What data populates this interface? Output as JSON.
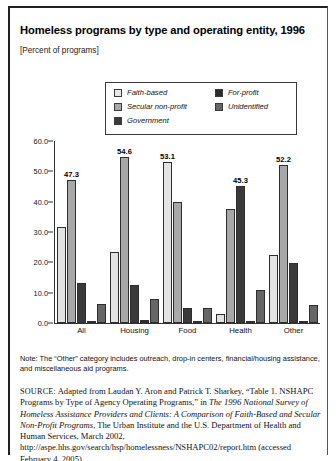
{
  "figure": {
    "title": "Homeless programs by type and operating entity, 1996",
    "subtitle": "[Percent of programs]",
    "note": "Note: The “Other” category includes outreach, drop-in centers, financial/housing assistance, and miscellaneous aid programs.",
    "source_label": "SOURCE:",
    "source_part1": " Adapted from Laudan Y. Aron and Patrick T. Sharkey, “Table 1. NSHAPC Programs by Type of Agency Operating Programs,” in ",
    "source_italic1": "The 1996 National Survey of Homeless Assistance Providers and Clients: A Comparison of Faith-Based and Secular Non-Profit Programs",
    "source_part2": ", The Urban Institute and the U.S. Department of Health and Human Services, March 2002, http://aspe.hhs.gov/search/hsp/homelessness/NSHAPC02/report.htm (accessed February 4, 2005)"
  },
  "chart_data": {
    "type": "bar",
    "title": "Homeless programs by type and operating entity, 1996",
    "subtitle": "[Percent of programs]",
    "xlabel": "",
    "ylabel": "",
    "ylim": [
      0.0,
      60.0
    ],
    "yticks": [
      "0.0",
      "10.0",
      "20.0",
      "30.0",
      "40.0",
      "50.0",
      "60.0"
    ],
    "ytick_values": [
      0.0,
      10.0,
      20.0,
      30.0,
      40.0,
      50.0,
      60.0
    ],
    "grid": false,
    "legend_position": "top-center",
    "categories": [
      "All",
      "Housing",
      "Food",
      "Health",
      "Other"
    ],
    "series": [
      {
        "name": "Faith-based",
        "color": "#e3e3e3",
        "values": [
          31.6,
          23.5,
          53.1,
          3.0,
          22.5
        ],
        "labels": [
          "",
          "",
          "53.1",
          "",
          ""
        ]
      },
      {
        "name": "Secular non-profit",
        "color": "#a8a8a8",
        "values": [
          47.3,
          54.6,
          40.0,
          37.5,
          52.2
        ],
        "labels": [
          "47.3",
          "54.6",
          "",
          "",
          "52.2"
        ]
      },
      {
        "name": "Government",
        "color": "#3a3a3a",
        "values": [
          13.2,
          12.5,
          5.0,
          45.3,
          19.8
        ],
        "labels": [
          "",
          "",
          "",
          "45.3",
          ""
        ]
      },
      {
        "name": "For-profit",
        "color": "#2b2b2b",
        "values": [
          0.6,
          1.0,
          0.8,
          0.6,
          0.8
        ],
        "labels": [
          "",
          "",
          "",
          "",
          ""
        ]
      },
      {
        "name": "Unidentified",
        "color": "#666666",
        "values": [
          6.2,
          8.0,
          4.8,
          11.0,
          5.8
        ],
        "labels": [
          "",
          "",
          "",
          "",
          ""
        ]
      }
    ]
  }
}
